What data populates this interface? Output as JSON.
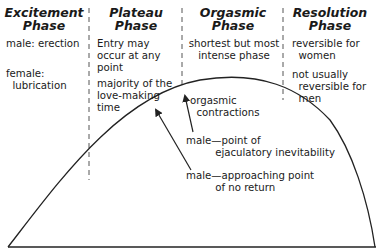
{
  "phases": [
    {
      "heading_line1": "Excitement",
      "heading_line2": "Phase",
      "notes": [
        {
          "text": "male: erection"
        },
        {
          "text": "female:\n  lubrication"
        }
      ]
    },
    {
      "heading_line1": "Plateau",
      "heading_line2": "Phase",
      "notes": [
        {
          "text": "Entry may\noccur at any\npoint"
        },
        {
          "text": "majority of the\nlove-making\ntime"
        }
      ]
    },
    {
      "heading_line1": "Orgasmic",
      "heading_line2": "Phase",
      "notes": [
        {
          "text": "shortest but most\nintense phase"
        }
      ]
    },
    {
      "heading_line1": "Resolution",
      "heading_line2": "Phase",
      "notes": [
        {
          "text": "reversible for\n  women"
        },
        {
          "text": "not usually\n  reversible for\n  men"
        }
      ]
    }
  ],
  "annotations": {
    "orgasmic_contractions": "orgasmic\n  contractions",
    "point_of_inevitability": "male—point of\n         ejaculatory inevitability",
    "approaching_no_return": "male—approaching point\n         of no return"
  },
  "colors": {
    "line": "#222222",
    "dashed": "#555555",
    "text": "#1a1a1a"
  }
}
